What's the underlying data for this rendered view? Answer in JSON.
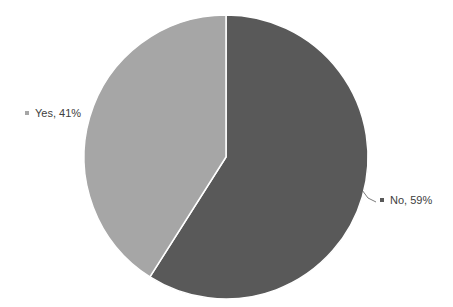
{
  "chart_data": {
    "type": "pie",
    "title": "",
    "categories": [
      "No",
      "Yes"
    ],
    "values": [
      59,
      41
    ],
    "unit": "%",
    "colors": [
      "#595959",
      "#a6a6a6"
    ],
    "labels": [
      "No, 59%",
      "Yes, 41%"
    ],
    "start_angle_deg": 0,
    "direction": "clockwise",
    "legend": "none (data labels with category and percentage)",
    "label_positions": {
      "No": "outside right with leader line",
      "Yes": "outside left"
    }
  },
  "labels": {
    "no": "No, 59%",
    "yes": "Yes, 41%"
  }
}
